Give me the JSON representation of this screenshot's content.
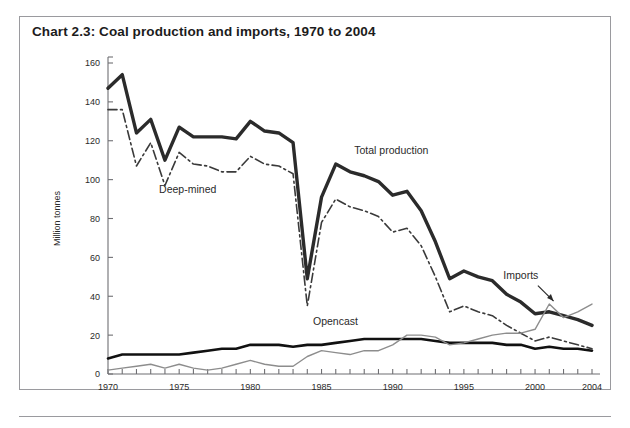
{
  "page": {
    "top_cut_text": "",
    "background_color": "#ffffff"
  },
  "chart_panel": {
    "title": "Chart 2.3: Coal production and imports, 1970 to 2004",
    "border_color": "#9a9a9e"
  },
  "chart_data": {
    "type": "line",
    "title": "Chart 2.3: Coal production and imports, 1970 to 2004",
    "xlabel": "",
    "ylabel": "Million tonnes",
    "xlim": [
      1970,
      2004
    ],
    "ylim": [
      0,
      160
    ],
    "ytick_labels": [
      "0",
      "20",
      "40",
      "60",
      "80",
      "100",
      "120",
      "140",
      "160"
    ],
    "yticks": [
      0,
      20,
      40,
      60,
      80,
      100,
      120,
      140,
      160
    ],
    "xtick_labels": [
      "1970",
      "1975",
      "1980",
      "1985",
      "1990",
      "1995",
      "2000",
      "2004"
    ],
    "xticks": [
      1970,
      1975,
      1980,
      1985,
      1990,
      1995,
      2000,
      2004
    ],
    "minor_xticks_every": 1,
    "grid": false,
    "legend": "inline-annotations",
    "x": [
      1970,
      1971,
      1972,
      1973,
      1974,
      1975,
      1976,
      1977,
      1978,
      1979,
      1980,
      1981,
      1982,
      1983,
      1984,
      1985,
      1986,
      1987,
      1988,
      1989,
      1990,
      1991,
      1992,
      1993,
      1994,
      1995,
      1996,
      1997,
      1998,
      1999,
      2000,
      2001,
      2002,
      2003,
      2004
    ],
    "series": [
      {
        "name": "Total production",
        "style": "solid",
        "color": "#2b2b2b",
        "width": 3.4,
        "label_x": 1987.3,
        "label_y": 113,
        "values": [
          147,
          154,
          124,
          131,
          110,
          127,
          122,
          122,
          122,
          121,
          130,
          125,
          124,
          119,
          49,
          91,
          108,
          104,
          102,
          99,
          92,
          94,
          84,
          68,
          49,
          53,
          50,
          48,
          41,
          37,
          31,
          32,
          30,
          28,
          25
        ]
      },
      {
        "name": "Deep-mined",
        "style": "dashdot",
        "color": "#3a3a3a",
        "width": 1.6,
        "label_x": 1975.6,
        "label_y": 93,
        "values": [
          136,
          136,
          107,
          119,
          97,
          114,
          108,
          107,
          104,
          104,
          112,
          108,
          107,
          103,
          35,
          78,
          90,
          86,
          84,
          81,
          73,
          75,
          66,
          50,
          32,
          35,
          32,
          30,
          25,
          21,
          17,
          19,
          17,
          15,
          13
        ]
      },
      {
        "name": "Opencast",
        "style": "solid",
        "color": "#111111",
        "width": 2.6,
        "label_x": 1984.4,
        "label_y": 25,
        "values": [
          8,
          10,
          10,
          10,
          10,
          10,
          11,
          12,
          13,
          13,
          15,
          15,
          15,
          14,
          15,
          15,
          16,
          17,
          18,
          18,
          18,
          18,
          18,
          17,
          16,
          16,
          16,
          16,
          15,
          15,
          13,
          14,
          13,
          13,
          12
        ]
      },
      {
        "name": "Imports",
        "style": "solid",
        "color": "#8d8d8d",
        "width": 1.4,
        "label_x": 1999.0,
        "label_y": 49,
        "values": [
          2,
          3,
          4,
          5,
          3,
          5,
          3,
          2,
          3,
          5,
          7,
          5,
          4,
          4,
          9,
          12,
          11,
          10,
          12,
          12,
          15,
          20,
          20,
          19,
          15,
          16,
          18,
          20,
          21,
          21,
          23,
          36,
          29,
          32,
          36
        ]
      }
    ],
    "annotations": [
      {
        "text": "Total production",
        "series": "Total production"
      },
      {
        "text": "Deep-mined",
        "series": "Deep-mined"
      },
      {
        "text": "Opencast",
        "series": "Opencast"
      },
      {
        "text": "Imports",
        "series": "Imports",
        "has_arrow": true
      }
    ]
  }
}
